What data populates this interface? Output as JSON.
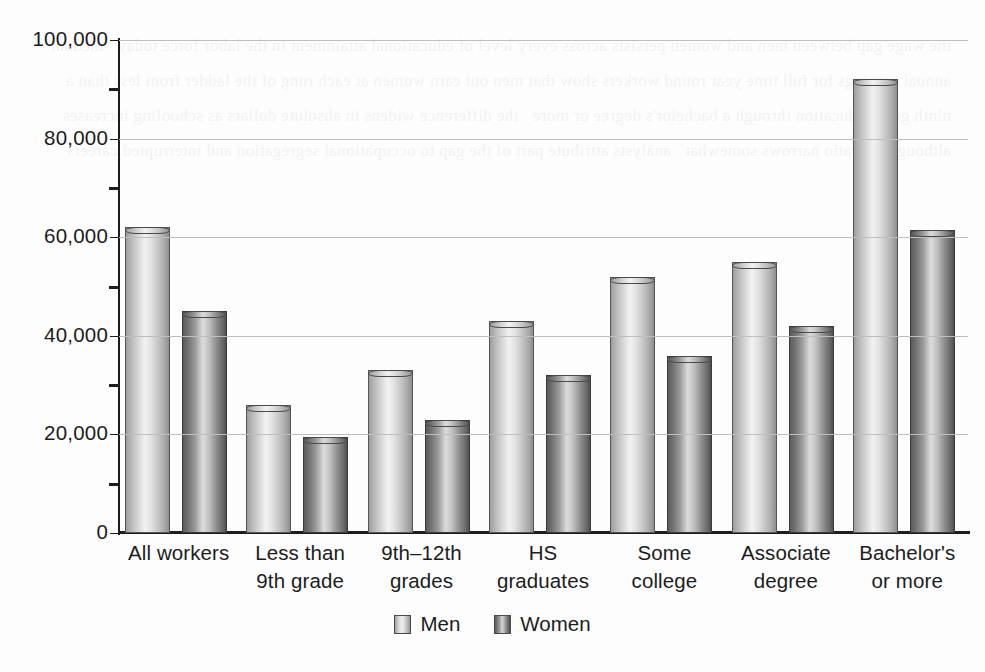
{
  "chart_data": {
    "type": "bar",
    "title": "",
    "xlabel": "",
    "ylabel": "",
    "ylim": [
      0,
      100000
    ],
    "ytick_labels": [
      "0",
      "20,000",
      "40,000",
      "60,000",
      "80,000",
      "100,000"
    ],
    "ytick_values": [
      0,
      20000,
      40000,
      60000,
      80000,
      100000
    ],
    "minor_ticks": [
      10000,
      30000,
      50000,
      70000,
      90000
    ],
    "grid": "horizontal",
    "legend_position": "bottom-center",
    "categories": [
      "All workers",
      "Less than 9th grade",
      "9th–12th grades",
      "HS graduates",
      "Some college",
      "Associate degree",
      "Bachelor's or more"
    ],
    "category_lines": [
      [
        "All workers"
      ],
      [
        "Less than",
        "9th grade"
      ],
      [
        "9th–12th",
        "grades"
      ],
      [
        "HS",
        "graduates"
      ],
      [
        "Some",
        "college"
      ],
      [
        "Associate",
        "degree"
      ],
      [
        "Bachelor's",
        "or more"
      ]
    ],
    "series": [
      {
        "name": "Men",
        "color": "#d9d9d9",
        "values": [
          62000,
          26000,
          33000,
          43000,
          52000,
          55000,
          92000
        ]
      },
      {
        "name": "Women",
        "color": "#808080",
        "values": [
          45000,
          19500,
          23000,
          32000,
          36000,
          42000,
          61500
        ]
      }
    ]
  },
  "legend": {
    "items": [
      {
        "label": "Men",
        "swatch": "men-swatch"
      },
      {
        "label": "Women",
        "swatch": "women-swatch"
      }
    ]
  },
  "page_ghost_text": "the wage gap between men and women persists across every level of educational attainment in the labor force today   median annual earnings for full time year round workers show that men out earn women at each rung of the ladder from less than a ninth grade education through a bachelor's degree or more   the difference widens in absolute dollars as schooling increases   although the ratio narrows somewhat   analysts attribute part of the gap to occupational segregation and interrupted careers"
}
